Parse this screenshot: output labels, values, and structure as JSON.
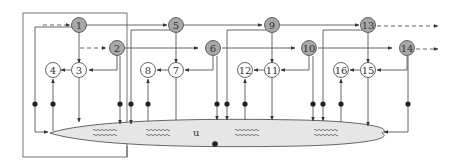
{
  "diagram": {
    "type": "signal-flow network",
    "frame_label": "",
    "colors": {
      "line": "#555555",
      "shaded_node": "#a8a8a8",
      "white_node": "#ffffff",
      "ellipse_fill": "#e6e6e6",
      "dot": "#222222"
    },
    "reservoir": {
      "label": "u"
    },
    "nodes": [
      {
        "id": "1",
        "label": "1",
        "shaded": true
      },
      {
        "id": "2",
        "label": "2",
        "shaded": true
      },
      {
        "id": "3",
        "label": "3",
        "shaded": false
      },
      {
        "id": "4",
        "label": "4",
        "shaded": false
      },
      {
        "id": "5",
        "label": "5",
        "shaded": true
      },
      {
        "id": "6",
        "label": "6",
        "shaded": true
      },
      {
        "id": "7",
        "label": "7",
        "shaded": false
      },
      {
        "id": "8",
        "label": "8",
        "shaded": false
      },
      {
        "id": "9",
        "label": "9",
        "shaded": true
      },
      {
        "id": "10",
        "label": "10",
        "shaded": true
      },
      {
        "id": "11",
        "label": "11",
        "shaded": false
      },
      {
        "id": "12",
        "label": "12",
        "shaded": false
      },
      {
        "id": "13",
        "label": "13",
        "shaded": true
      },
      {
        "id": "14",
        "label": "14",
        "shaded": true
      },
      {
        "id": "15",
        "label": "15",
        "shaded": false
      },
      {
        "id": "16",
        "label": "16",
        "shaded": false
      }
    ],
    "edges": [
      {
        "from": "1",
        "to": "3"
      },
      {
        "from": "2",
        "to": "3"
      },
      {
        "from": "3",
        "to": "4"
      },
      {
        "from": "1",
        "to": "5"
      },
      {
        "from": "2",
        "to": "6"
      },
      {
        "from": "5",
        "to": "7"
      },
      {
        "from": "6",
        "to": "7"
      },
      {
        "from": "7",
        "to": "8"
      },
      {
        "from": "5",
        "to": "9"
      },
      {
        "from": "6",
        "to": "10"
      },
      {
        "from": "9",
        "to": "11"
      },
      {
        "from": "10",
        "to": "11"
      },
      {
        "from": "11",
        "to": "12"
      },
      {
        "from": "9",
        "to": "13"
      },
      {
        "from": "10",
        "to": "14"
      },
      {
        "from": "13",
        "to": "15"
      },
      {
        "from": "14",
        "to": "15"
      },
      {
        "from": "15",
        "to": "16"
      }
    ]
  }
}
